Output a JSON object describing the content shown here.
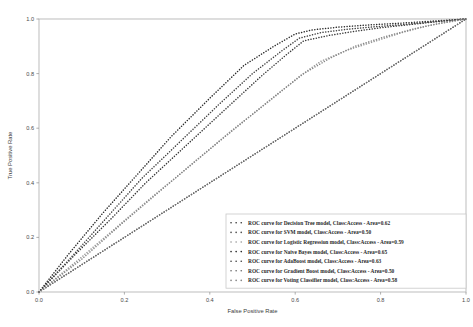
{
  "chart_data": {
    "type": "line",
    "title": "",
    "xlabel": "False Positive Rate",
    "ylabel": "True Positive Rate",
    "xlim": [
      0.0,
      1.0
    ],
    "ylim": [
      0.0,
      1.0
    ],
    "xticks": [
      "0.0",
      "0.2",
      "0.4",
      "0.6",
      "0.8",
      "1.0"
    ],
    "yticks": [
      "0.0",
      "0.2",
      "0.4",
      "0.6",
      "0.8",
      "1.0"
    ],
    "xtick_values": [
      0.0,
      0.2,
      0.4,
      0.6,
      0.8,
      1.0
    ],
    "ytick_values": [
      0.0,
      0.2,
      0.4,
      0.6,
      0.8,
      1.0
    ],
    "grid": false,
    "linestyle": "dotted",
    "legend_position": "lower right",
    "series": [
      {
        "name": "ROC curve for Decision Tree model, Class:Access - Area=0.62",
        "model": "Decision Tree",
        "class_label": "Access",
        "area": "0.62",
        "color": "#3a3a3a",
        "x": [
          0.0,
          0.08,
          0.17,
          0.25,
          0.34,
          0.43,
          0.52,
          0.58,
          0.62,
          0.68,
          0.74,
          0.8,
          0.86,
          0.93,
          1.0
        ],
        "y": [
          0.0,
          0.13,
          0.27,
          0.4,
          0.53,
          0.66,
          0.79,
          0.87,
          0.92,
          0.94,
          0.955,
          0.968,
          0.978,
          0.99,
          1.0
        ]
      },
      {
        "name": "ROC curve for SVM model, Class:Access - Area=0.50",
        "model": "SVM",
        "class_label": "Access",
        "area": "0.50",
        "color": "#555555",
        "x": [
          0.0,
          0.1,
          0.2,
          0.3,
          0.4,
          0.5,
          0.6,
          0.7,
          0.8,
          0.9,
          1.0
        ],
        "y": [
          0.0,
          0.1,
          0.2,
          0.3,
          0.4,
          0.5,
          0.6,
          0.7,
          0.8,
          0.9,
          1.0
        ]
      },
      {
        "name": "ROC curve for Logistic Regression model, Class:Access - Area=0.59",
        "model": "Logistic Regression",
        "class_label": "Access",
        "area": "0.59",
        "color": "#9a9a9a",
        "x": [
          0.0,
          0.09,
          0.18,
          0.27,
          0.36,
          0.45,
          0.54,
          0.61,
          0.66,
          0.72,
          0.79,
          0.85,
          0.91,
          1.0
        ],
        "y": [
          0.0,
          0.115,
          0.235,
          0.355,
          0.47,
          0.59,
          0.7,
          0.79,
          0.845,
          0.885,
          0.92,
          0.95,
          0.975,
          1.0
        ]
      },
      {
        "name": "ROC curve for Naive Bayes model, Class:Access - Area=0.65",
        "model": "Naive Bayes",
        "class_label": "Access",
        "area": "0.65",
        "color": "#2c2c2c",
        "x": [
          0.0,
          0.07,
          0.15,
          0.23,
          0.31,
          0.4,
          0.48,
          0.55,
          0.6,
          0.64,
          0.7,
          0.77,
          0.85,
          0.93,
          1.0
        ],
        "y": [
          0.0,
          0.14,
          0.29,
          0.43,
          0.57,
          0.71,
          0.83,
          0.9,
          0.945,
          0.96,
          0.97,
          0.978,
          0.985,
          0.993,
          1.0
        ]
      },
      {
        "name": "ROC curve for AdaBoost model, Class:Access - Area=0.63",
        "model": "AdaBoost",
        "class_label": "Access",
        "area": "0.63",
        "color": "#444444",
        "x": [
          0.0,
          0.08,
          0.16,
          0.24,
          0.33,
          0.42,
          0.5,
          0.57,
          0.61,
          0.66,
          0.72,
          0.79,
          0.87,
          0.94,
          1.0
        ],
        "y": [
          0.0,
          0.135,
          0.275,
          0.415,
          0.55,
          0.685,
          0.8,
          0.885,
          0.93,
          0.95,
          0.962,
          0.972,
          0.982,
          0.992,
          1.0
        ]
      },
      {
        "name": "ROC curve for Gradient Boost model, Class:Access - Area=0.50",
        "model": "Gradient Boost",
        "class_label": "Access",
        "area": "0.50",
        "color": "#6e6e6e",
        "x": [
          0.0,
          0.1,
          0.2,
          0.3,
          0.4,
          0.5,
          0.6,
          0.7,
          0.8,
          0.9,
          1.0
        ],
        "y": [
          0.0,
          0.1,
          0.2,
          0.3,
          0.4,
          0.5,
          0.6,
          0.7,
          0.8,
          0.9,
          1.0
        ]
      },
      {
        "name": "ROC curve for Voting Classifier model, Class:Access - Area=0.58",
        "model": "Voting Classifier",
        "class_label": "Access",
        "area": "0.58",
        "color": "#888888",
        "x": [
          0.0,
          0.1,
          0.19,
          0.28,
          0.37,
          0.46,
          0.55,
          0.62,
          0.68,
          0.74,
          0.81,
          0.88,
          0.94,
          1.0
        ],
        "y": [
          0.0,
          0.12,
          0.245,
          0.365,
          0.485,
          0.6,
          0.715,
          0.8,
          0.855,
          0.9,
          0.935,
          0.965,
          0.985,
          1.0
        ]
      }
    ]
  },
  "axes": {
    "frame_color": "#b5b5b5",
    "tick_color": "#9a9a9a"
  },
  "legend": {
    "border_color": "#c9c9c9",
    "background": "#ffffff"
  }
}
